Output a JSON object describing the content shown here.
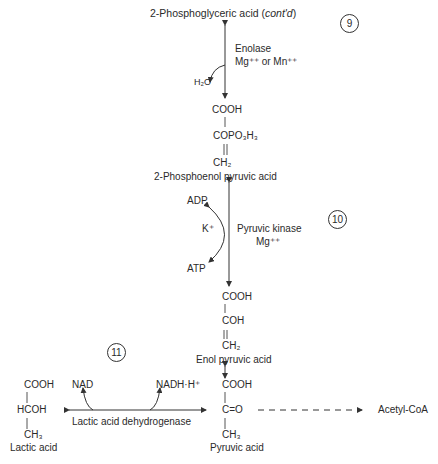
{
  "step9": {
    "title_main": "2-Phosphoglyceric acid (",
    "title_italic": "cont'd",
    "title_end": ")",
    "enzyme": "Enolase",
    "cofactor": "Mg⁺⁺ or Mn⁺⁺",
    "byproduct": "H₂O",
    "number": "9"
  },
  "pep": {
    "line1": "COOH",
    "line2": "COPO₃H₃",
    "line3": "CH₂",
    "name": "2-Phosphoenol pyruvic acid"
  },
  "step10": {
    "enzyme": "Pyruvic kinase",
    "cofactor": "Mg⁺⁺",
    "ion": "K⁺",
    "input": "ADP",
    "output": "ATP",
    "number": "10"
  },
  "enol": {
    "line1": "COOH",
    "line2": "COH",
    "line3": "CH₂",
    "name": "Enol pyruvic acid"
  },
  "pyruvic": {
    "line1": "COOH",
    "line2": "C=O",
    "line3": "CH₃",
    "name": "Pyruvic acid"
  },
  "lactic": {
    "line1": "COOH",
    "line2": "HCOH",
    "line3": "CH₃",
    "name": "Lactic acid"
  },
  "step11": {
    "enzyme": "Lactic acid dehydrogenase",
    "left_cofactor": "NAD",
    "right_cofactor": "NADH·H⁺",
    "number": "11"
  },
  "acetyl": {
    "label": "Acetyl-CoA"
  }
}
